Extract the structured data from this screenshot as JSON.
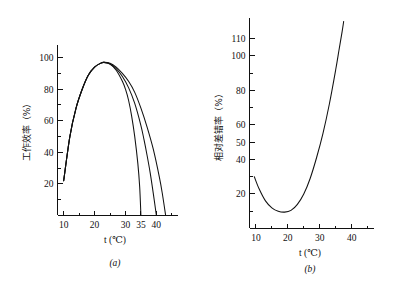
{
  "figure": {
    "background_color": "#ffffff",
    "ink_color": "#111111",
    "panel_count": 2
  },
  "chart_data": [
    {
      "id": "panel-a",
      "type": "line",
      "title": "",
      "caption": "(a)",
      "xlabel": "t (℃)",
      "ylabel": "工作效率（%）",
      "xlim": [
        8,
        47
      ],
      "ylim": [
        0,
        108
      ],
      "grid": false,
      "legend": null,
      "x_ticks_labeled": [
        10,
        20,
        30,
        35,
        40
      ],
      "x_tick_labels": [
        "10",
        "20",
        "30",
        "35",
        "40"
      ],
      "x_ticks_minor": [
        15,
        25,
        45
      ],
      "y_ticks_labeled": [
        20,
        40,
        60,
        80,
        100
      ],
      "y_tick_labels": [
        "20",
        "40",
        "60",
        "80",
        "100"
      ],
      "y_ticks_minor": [
        10,
        30,
        50,
        70,
        90
      ],
      "series": [
        {
          "name": "curve-1",
          "x": [
            10,
            12,
            14,
            16,
            18,
            20,
            22,
            23,
            25,
            27,
            29,
            30,
            31,
            32,
            33,
            34,
            34.6,
            35
          ],
          "y": [
            22,
            50,
            68,
            80,
            89,
            94,
            96.5,
            97,
            96,
            92,
            85,
            80,
            73,
            63,
            50,
            33,
            18,
            0
          ]
        },
        {
          "name": "curve-2",
          "x": [
            10,
            12,
            14,
            16,
            18,
            20,
            22,
            23,
            25,
            27,
            29,
            31,
            33,
            35,
            36,
            37,
            38,
            39,
            40
          ],
          "y": [
            22,
            50,
            68,
            80,
            89,
            94,
            96.5,
            97,
            96,
            93,
            88,
            81,
            71,
            57,
            48,
            38,
            27,
            14,
            0
          ]
        },
        {
          "name": "curve-3",
          "x": [
            10,
            12,
            14,
            16,
            18,
            20,
            22,
            23,
            25,
            27,
            29,
            31,
            33,
            35,
            37,
            39,
            41,
            42,
            43
          ],
          "y": [
            22,
            50,
            68,
            80,
            89,
            94,
            96.5,
            97,
            96.5,
            94,
            90,
            85,
            78,
            68,
            56,
            42,
            24,
            13,
            0
          ]
        }
      ]
    },
    {
      "id": "panel-b",
      "type": "line",
      "title": "",
      "caption": "(b)",
      "xlabel": "t (℃)",
      "ylabel": "相对差错率（%）",
      "xlim": [
        8,
        47
      ],
      "ylim": [
        0,
        122
      ],
      "grid": false,
      "legend": null,
      "x_ticks_labeled": [
        10,
        20,
        30,
        40
      ],
      "x_tick_labels": [
        "10",
        "20",
        "30",
        "40"
      ],
      "x_ticks_minor": [
        15,
        25,
        35,
        45
      ],
      "y_ticks_labeled": [
        20,
        40,
        50,
        60,
        80,
        100,
        110
      ],
      "y_tick_labels": [
        "20",
        "40",
        "50",
        "60",
        "80",
        "100",
        "110"
      ],
      "y_ticks_minor": [
        10,
        30,
        70,
        90
      ],
      "series": [
        {
          "name": "curve-1",
          "x": [
            9.5,
            11,
            13,
            15,
            17,
            19,
            21,
            23,
            25,
            27,
            29,
            31,
            33,
            35,
            36,
            37,
            37.5
          ],
          "y": [
            30,
            23,
            16,
            12,
            10,
            9.5,
            10.5,
            14,
            20,
            29,
            41,
            55,
            72,
            92,
            103,
            114,
            120
          ]
        }
      ]
    }
  ]
}
